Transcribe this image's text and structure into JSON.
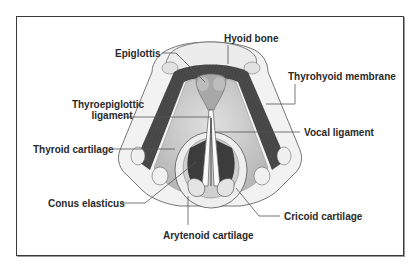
{
  "diagram": {
    "labels": [
      {
        "id": "hyoid-bone",
        "text": "Hyoid bone"
      },
      {
        "id": "epiglottis",
        "text": "Epiglottis"
      },
      {
        "id": "thyrohyoid-membrane",
        "text": "Thyrohyoid membrane"
      },
      {
        "id": "thyroepiglottic-ligament",
        "line1": "Thyroepiglottic",
        "line2": "ligament"
      },
      {
        "id": "vocal-ligament",
        "text": "Vocal ligament"
      },
      {
        "id": "thyroid-cartilage",
        "text": "Thyroid cartilage"
      },
      {
        "id": "conus-elasticus",
        "text": "Conus elasticus"
      },
      {
        "id": "cricoid-cartilage",
        "text": "Cricoid cartilage"
      },
      {
        "id": "arytenoid-cartilage",
        "text": "Arytenoid cartilage"
      }
    ],
    "colors": {
      "frame": "#3a3a3a",
      "text": "#2a2a2a",
      "leader_line": "#555555",
      "membrane_dark": "#4a4a4a",
      "cartilage_light": "#e8e8e8",
      "tissue_mid": "#bdbdbd"
    }
  }
}
